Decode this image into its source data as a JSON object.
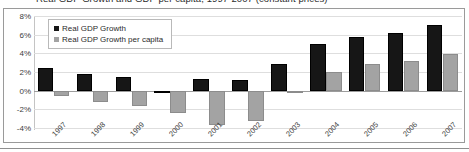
{
  "chart_data": {
    "type": "bar",
    "title": "Real GDP Growth and GDP per capita, 1997-2007 (constant prices)",
    "xlabel": "",
    "ylabel": "",
    "ylim": [
      -4,
      8
    ],
    "grid": true,
    "legend_position": "top-left",
    "categories": [
      "1997",
      "1998",
      "1999",
      "2000",
      "2001",
      "2002",
      "2003",
      "2004",
      "2005",
      "2006",
      "2007"
    ],
    "ytick_labels": [
      "8%",
      "6%",
      "4%",
      "2%",
      "0%",
      "-2%",
      "-4%"
    ],
    "ytick_values": [
      8,
      6,
      4,
      2,
      0,
      -2,
      -4
    ],
    "series": [
      {
        "name": "Real GDP Growth",
        "color": "#161616",
        "values": [
          2.4,
          1.8,
          1.5,
          -0.2,
          1.2,
          1.1,
          2.9,
          5.0,
          5.8,
          6.2,
          7.0
        ]
      },
      {
        "name": "Real GDP Growth per capita",
        "color": "#a3a3a3",
        "values": [
          -0.6,
          -1.2,
          -1.6,
          -2.4,
          -3.7,
          -3.3,
          -0.05,
          2.0,
          2.9,
          3.2,
          3.9
        ]
      }
    ]
  }
}
